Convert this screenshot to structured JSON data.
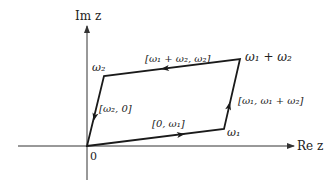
{
  "diagram": {
    "axes": {
      "x_label": "Re z",
      "y_label": "Im z",
      "origin_label": "0"
    },
    "vertices": {
      "origin": "0",
      "w1": "ω₁",
      "w2": "ω₂",
      "w1_plus_w2": "ω₁ + ω₂"
    },
    "edges": [
      {
        "id": "bottom",
        "label": "[0, ω₁]",
        "from": "0",
        "to": "ω₁",
        "arrow": "toward ω₁"
      },
      {
        "id": "right",
        "label": "[ω₁, ω₁ + ω₂]",
        "from": "ω₁",
        "to": "ω₁ + ω₂",
        "arrow": "toward ω₁ + ω₂"
      },
      {
        "id": "top",
        "label": "[ω₁ + ω₂, ω₂]",
        "from": "ω₁ + ω₂",
        "to": "ω₂",
        "arrow": "toward ω₂"
      },
      {
        "id": "left",
        "label": "[ω₂, 0]",
        "from": "ω₂",
        "to": "0",
        "arrow": "toward 0"
      }
    ],
    "colors": {
      "stroke": "#1a1a1a",
      "axis": "#333333",
      "text": "#222222"
    }
  }
}
